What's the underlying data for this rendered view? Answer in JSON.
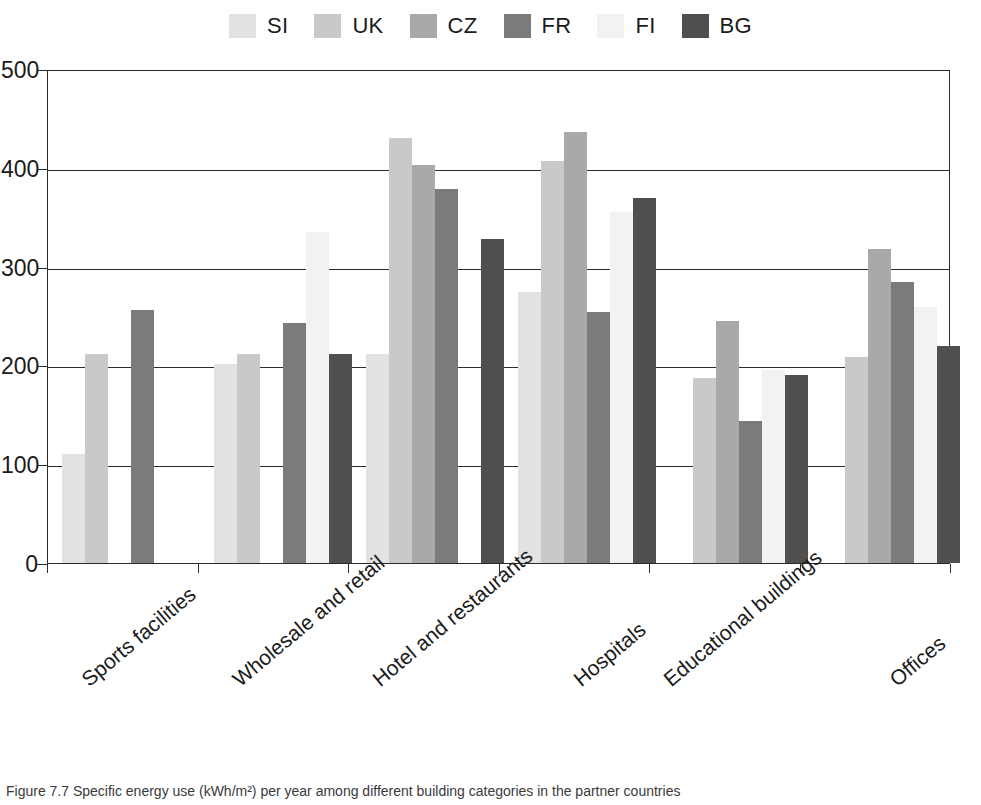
{
  "chart_data": {
    "type": "bar",
    "title": "",
    "subtitle": "",
    "xlabel": "",
    "ylabel": "",
    "ylim": [
      0,
      500
    ],
    "yticks": [
      0,
      100,
      200,
      300,
      400,
      500
    ],
    "grid": true,
    "legend_position": "top-center",
    "categories": [
      "Sports facilities",
      "Wholesale and retail",
      "Hotel and restaurants",
      "Hospitals",
      "Educational buildings",
      "Offices"
    ],
    "series": [
      {
        "name": "SI",
        "color": "#e2e2e2",
        "values": [
          110,
          201,
          212,
          274,
          null,
          null
        ]
      },
      {
        "name": "UK",
        "color": "#c9c9c9",
        "values": [
          212,
          212,
          430,
          407,
          187,
          209
        ]
      },
      {
        "name": "CZ",
        "color": "#a9a9a9",
        "values": [
          null,
          null,
          403,
          436,
          245,
          318
        ]
      },
      {
        "name": "FR",
        "color": "#7b7b7b",
        "values": [
          256,
          243,
          379,
          254,
          144,
          284
        ]
      },
      {
        "name": "FI",
        "color": "#f2f2f2",
        "values": [
          null,
          335,
          null,
          355,
          195,
          259
        ]
      },
      {
        "name": "BG",
        "color": "#4f4f4f",
        "values": [
          null,
          212,
          328,
          369,
          190,
          220
        ]
      }
    ]
  },
  "legend": {
    "items": [
      {
        "label": "SI"
      },
      {
        "label": "UK"
      },
      {
        "label": "CZ"
      },
      {
        "label": "FR"
      },
      {
        "label": "FI"
      },
      {
        "label": "BG"
      }
    ]
  },
  "caption": {
    "text": "Figure 7.7 Specific energy use (kWh/m²) per year among different building categories in the partner countries"
  }
}
